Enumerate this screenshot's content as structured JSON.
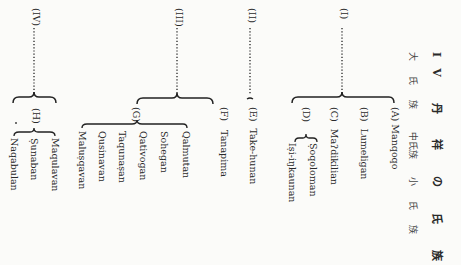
{
  "title": {
    "number": "IV",
    "text": "丹 祥 の 氏 族"
  },
  "column_headers": [
    "大 氏 族",
    "中氏族",
    "小 氏 族"
  ],
  "groups": [
    {
      "label": "(I)",
      "clans": [
        {
          "label": "(A)",
          "name": "Manqoqo"
        },
        {
          "label": "(B)",
          "name": "Lumeligan"
        },
        {
          "label": "(C)",
          "name": "Maʔdikilian"
        },
        {
          "label": "(D)",
          "subclans": [
            "Ṣoqoloman",
            "Iṣi-iŋkaunan"
          ]
        }
      ]
    },
    {
      "label": "(II)",
      "clans": [
        {
          "label": "(E)",
          "name": "Take-hunan"
        }
      ]
    },
    {
      "label": "(III)",
      "clans": [
        {
          "label": "(F)",
          "name": "Tanapima"
        },
        {
          "label": "(G)",
          "subclans": [
            "Qalmutan",
            "Sohegan",
            "Qativogan",
            "Taqunaṣan",
            "Qusinavan",
            "Maluṣqavan"
          ]
        }
      ]
    },
    {
      "label": "(IV)",
      "clans": [
        {
          "label": "(H)",
          "subclans": [
            "Maqulavan",
            "Ṣunaban",
            "Naqabulan"
          ]
        }
      ]
    }
  ]
}
